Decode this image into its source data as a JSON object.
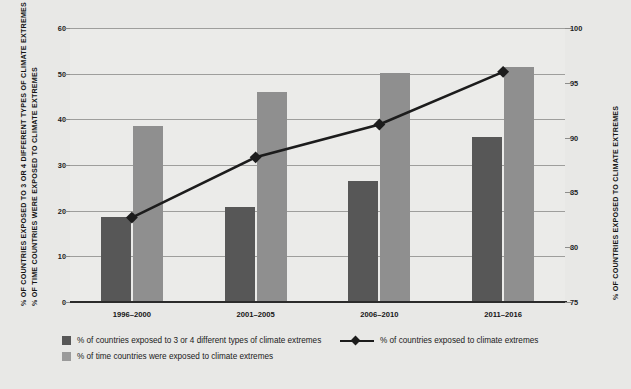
{
  "chart_data": {
    "type": "bar",
    "title": "",
    "categories": [
      "1996–2000",
      "2001–2005",
      "2006–2010",
      "2011–2016"
    ],
    "series": [
      {
        "name": "% of countries exposed to 3 or 4 different types of climate extremes",
        "type": "bar",
        "axis": "left",
        "color": "#575757",
        "values": [
          18.6,
          20.8,
          26.4,
          36.2
        ]
      },
      {
        "name": "% of time countries were exposed to climate extremes",
        "type": "bar",
        "axis": "left",
        "color": "#8f8f8f",
        "values": [
          38.5,
          46.0,
          50.2,
          51.5
        ]
      },
      {
        "name": "% of countries exposed to climate extremes",
        "type": "line",
        "axis": "right",
        "color": "#1c1c1c",
        "marker": "diamond",
        "values": [
          82.7,
          88.2,
          91.2,
          96.0
        ]
      }
    ],
    "xlabel": "",
    "ylabel": "% OF COUNTRIES EXPOSED TO 3 OR 4 DIFFERENT TYPES OF CLIMATE EXTREMES",
    "ylabel2": "% OF TIME COUNTRIES WERE EXPOSED TO CLIMATE EXTREMES",
    "ylabel_right": "% OF COUNTRIES EXPOSED TO CLIMATE EXTREMES",
    "ylim": [
      0,
      60
    ],
    "ylim_right": [
      75,
      100
    ],
    "yticks": [
      "60",
      "50",
      "40",
      "30",
      "20",
      "10",
      "0"
    ],
    "yticks_right": [
      "100",
      "95",
      "90",
      "85",
      "80",
      "75"
    ],
    "grid": true,
    "legend_position": "bottom"
  },
  "legend": {
    "items": [
      {
        "label": "% of countries exposed to 3 or 4 different types of climate extremes",
        "marker": "dark-square"
      },
      {
        "label": "% of time countries were exposed to climate extremes",
        "marker": "light-square"
      },
      {
        "label": "% of countries exposed to climate extremes",
        "marker": "line-diamond"
      }
    ]
  },
  "colors": {
    "background": "#e8e8e6",
    "plot_background": "#ebebe9",
    "gridline": "#9e9e9c",
    "bar_dark": "#575757",
    "bar_light": "#8f8f8f",
    "line": "#1c1c1c",
    "axis": "#2b2b2b"
  }
}
